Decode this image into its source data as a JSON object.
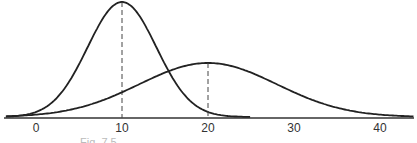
{
  "figure": {
    "caption": "Fig. 7.5",
    "axis": {
      "ticks": [
        0,
        10,
        20,
        30,
        40
      ],
      "xmin": -3.5,
      "xmax": 44
    },
    "curves": [
      {
        "name": "narrow-normal",
        "mean": 10,
        "sd": 4,
        "peak_px": 115,
        "xmin": -3.5,
        "xmax": 25
      },
      {
        "name": "wide-normal",
        "mean": 20,
        "sd": 8,
        "peak_px": 54,
        "xmin": -3.5,
        "xmax": 44
      }
    ]
  },
  "chart_data": {
    "type": "line",
    "title": "",
    "xlabel": "",
    "ylabel": "",
    "x_ticks": [
      0,
      10,
      20,
      30,
      40
    ],
    "series": [
      {
        "name": "Normal curve (mean 10, small spread)",
        "mean": 10,
        "sd": 4,
        "relative_peak": 1.0
      },
      {
        "name": "Normal curve (mean 20, large spread)",
        "mean": 20,
        "sd": 8,
        "relative_peak": 0.47
      }
    ],
    "annotations": [
      "dashed vertical line at mean 10",
      "dashed vertical line at mean 20"
    ],
    "grid": false
  }
}
